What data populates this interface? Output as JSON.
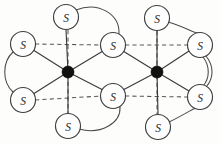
{
  "figure": {
    "background_color": "#fdfdfc",
    "bond_color": "#3b3b3b",
    "dashed_bond_color": "#585858",
    "atom_stroke_color": "#3f3f3f",
    "atom_fill_color": "#fefefe",
    "metal_color": "#111111"
  },
  "atoms": [
    {
      "id": "s-top-left",
      "label": "S",
      "x": 66,
      "y": 17,
      "r": 12.5
    },
    {
      "id": "s-left-upper",
      "label": "S",
      "x": 23,
      "y": 44,
      "r": 12.5
    },
    {
      "id": "s-left-lower",
      "label": "S",
      "x": 23,
      "y": 100,
      "r": 12.5
    },
    {
      "id": "s-bottom-left",
      "label": "S",
      "x": 68,
      "y": 126,
      "r": 12.5
    },
    {
      "id": "s-bridge-upper",
      "label": "S",
      "x": 113,
      "y": 45,
      "r": 12.5
    },
    {
      "id": "s-bridge-lower",
      "label": "S",
      "x": 113,
      "y": 96,
      "r": 12.5
    },
    {
      "id": "s-top-right",
      "label": "S",
      "x": 157,
      "y": 18,
      "r": 12.5
    },
    {
      "id": "s-bottom-right",
      "label": "S",
      "x": 158,
      "y": 127,
      "r": 12.5
    },
    {
      "id": "s-right-upper",
      "label": "S",
      "x": 200,
      "y": 45,
      "r": 12.5
    },
    {
      "id": "s-right-lower",
      "label": "S",
      "x": 200,
      "y": 97,
      "r": 12.5
    }
  ],
  "metals": [
    {
      "id": "metal-left",
      "label": "",
      "x": 68,
      "y": 72,
      "r": 6.0
    },
    {
      "id": "metal-right",
      "label": "",
      "x": 157,
      "y": 72,
      "r": 6.0
    }
  ],
  "bonds_solid": [
    {
      "id": "bond-ml-stopleft",
      "x1": 68,
      "y1": 72,
      "x2": 66,
      "y2": 29.5
    },
    {
      "id": "bond-ml-sbottomleft",
      "x1": 68,
      "y1": 72,
      "x2": 68,
      "y2": 113.5
    },
    {
      "id": "bond-ml-sleftupper",
      "x1": 68,
      "y1": 72,
      "x2": 34,
      "y2": 50.5
    },
    {
      "id": "bond-ml-sleftlower",
      "x1": 68,
      "y1": 72,
      "x2": 34,
      "y2": 93.5
    },
    {
      "id": "bond-ml-sbridgeupper",
      "x1": 68,
      "y1": 72,
      "x2": 103,
      "y2": 51
    },
    {
      "id": "bond-ml-sbridgelower",
      "x1": 68,
      "y1": 72,
      "x2": 103,
      "y2": 90
    },
    {
      "id": "bond-mr-stopright",
      "x1": 157,
      "y1": 72,
      "x2": 157,
      "y2": 30.5
    },
    {
      "id": "bond-mr-sbottomright",
      "x1": 157,
      "y1": 72,
      "x2": 158,
      "y2": 114.5
    },
    {
      "id": "bond-mr-sbridgeupper",
      "x1": 157,
      "y1": 72,
      "x2": 123,
      "y2": 51
    },
    {
      "id": "bond-mr-sbridgelower",
      "x1": 157,
      "y1": 72,
      "x2": 123,
      "y2": 90
    },
    {
      "id": "bond-mr-srightupper",
      "x1": 157,
      "y1": 72,
      "x2": 189,
      "y2": 51
    },
    {
      "id": "bond-mr-srightlower",
      "x1": 157,
      "y1": 72,
      "x2": 189,
      "y2": 91
    }
  ],
  "bonds_dashed": [
    {
      "id": "axis-upper-left",
      "x1": 35,
      "y1": 44,
      "x2": 101,
      "y2": 45
    },
    {
      "id": "axis-upper-right",
      "x1": 125,
      "y1": 45,
      "x2": 188,
      "y2": 45
    },
    {
      "id": "axis-lower-left",
      "x1": 35,
      "y1": 100,
      "x2": 101,
      "y2": 96
    },
    {
      "id": "axis-lower-right",
      "x1": 125,
      "y1": 96,
      "x2": 188,
      "y2": 97
    },
    {
      "id": "axis-vertical-left",
      "x1": 68,
      "y1": 30,
      "x2": 68,
      "y2": 114
    },
    {
      "id": "axis-vertical-right",
      "x1": 157,
      "y1": 31,
      "x2": 157,
      "y2": 115
    }
  ],
  "chelate_arcs": [
    {
      "id": "arc-left-ring",
      "d": "M 13 52 C 2 62, 2 82, 13 92"
    },
    {
      "id": "arc-top-left-ring",
      "d": "M 76 10 C 98 1, 120 14, 119 34"
    },
    {
      "id": "arc-bottom-left-ring",
      "d": "M 79 129 C 101 135, 121 123, 120 107"
    },
    {
      "id": "arc-top-right-ring",
      "d": "M 168 22 C 186 27, 195 34, 198 33"
    },
    {
      "id": "arc-bottom-right-ring",
      "d": "M 169 122 C 188 113, 197 105, 199 109"
    },
    {
      "id": "arc-right-ring-outer",
      "d": "M 206 56 C 214 66, 214 78, 206 87"
    },
    {
      "id": "arc-right-ring-inner",
      "d": "M 203 57 C 210 66, 210 78, 203 86"
    }
  ],
  "counts": {
    "sulfur_atoms": "10",
    "metal_centers": "2",
    "bridging_sulfurs": "2"
  }
}
